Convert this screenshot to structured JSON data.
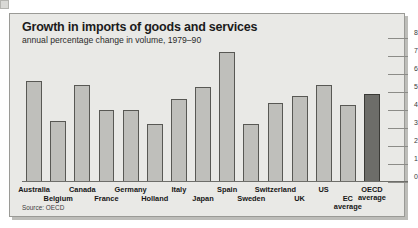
{
  "header": {
    "title": "Growth in imports of goods and services",
    "subtitle": "annual percentage change in volume, 1979–90"
  },
  "footer": {
    "source": "Source: OECD"
  },
  "colors": {
    "panel_background": "#e9e9e6",
    "panel_border": "#9a9a96",
    "bar_fill": "#bfbfbb",
    "bar_border": "#585854",
    "highlight_bar_fill": "#6d6d69",
    "axis_line": "#8c8c88",
    "page_background": "#ffffff"
  },
  "chart_data": {
    "type": "bar",
    "title": "Growth in imports of goods and services",
    "subtitle": "annual percentage change in volume, 1979–90",
    "xlabel": "",
    "ylabel": "",
    "ylim": [
      0,
      8
    ],
    "yticks": [
      0,
      1,
      2,
      3,
      4,
      5,
      6,
      7,
      8
    ],
    "ytick_labels": [
      "0",
      "1",
      "2",
      "3",
      "4",
      "5",
      "6",
      "7",
      "8"
    ],
    "grid": true,
    "axis_position": "right",
    "legend": false,
    "categories": [
      "Australia",
      "Belgium",
      "Canada",
      "France",
      "Germany",
      "Holland",
      "Italy",
      "Japan",
      "Spain",
      "Sweden",
      "Switzerland",
      "UK",
      "US",
      "EC average",
      "OECD average"
    ],
    "label_rows": [
      0,
      1,
      0,
      1,
      0,
      1,
      0,
      1,
      0,
      1,
      0,
      1,
      0,
      1,
      0
    ],
    "values": [
      5.6,
      3.4,
      5.4,
      4.0,
      4.0,
      3.2,
      4.6,
      5.3,
      7.2,
      3.2,
      4.4,
      4.8,
      5.4,
      4.3,
      4.9
    ],
    "highlight_index": 14
  }
}
